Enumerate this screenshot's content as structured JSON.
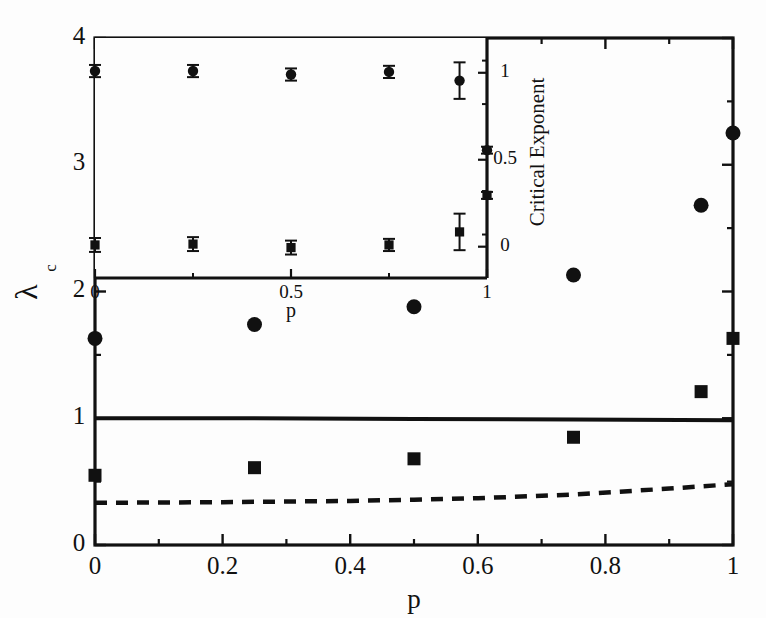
{
  "figure": {
    "background_color": "#fdfdfd",
    "ink_color": "#111111"
  },
  "chart_data": {
    "type": "scatter",
    "title": "",
    "xlabel": "p",
    "ylabel": "λ",
    "ylabel_subscript": "c",
    "xlim": [
      0,
      1
    ],
    "ylim": [
      0,
      4
    ],
    "grid": false,
    "legend_position": "none",
    "xticks": [
      0,
      0.2,
      0.4,
      0.6,
      0.8,
      1
    ],
    "xtick_labels": [
      "0",
      "0.2",
      "0.4",
      "0.6",
      "0.8",
      "1"
    ],
    "xminor_step": 0.1,
    "yticks": [
      0,
      1,
      2,
      3,
      4
    ],
    "ytick_labels": [
      "0",
      "1",
      "2",
      "3",
      "4"
    ],
    "yminor_step": 0.5,
    "series": [
      {
        "name": "circles",
        "marker": "circle",
        "x": [
          0,
          0.25,
          0.5,
          0.75,
          0.95,
          1.0
        ],
        "y": [
          1.63,
          1.74,
          1.88,
          2.13,
          2.68,
          3.25
        ]
      },
      {
        "name": "squares",
        "marker": "square",
        "x": [
          0,
          0.25,
          0.5,
          0.75,
          0.95,
          1.0
        ],
        "y": [
          0.55,
          0.61,
          0.68,
          0.85,
          1.21,
          1.63
        ]
      },
      {
        "name": "solid-line",
        "marker": "line-solid",
        "x": [
          0,
          0.25,
          0.5,
          0.75,
          1.0
        ],
        "y": [
          1.0,
          1.0,
          0.995,
          0.99,
          0.985
        ]
      },
      {
        "name": "dashed-line",
        "marker": "line-dashed",
        "x": [
          0,
          0.2,
          0.4,
          0.5,
          0.6,
          0.75,
          0.9,
          1.0
        ],
        "y": [
          0.333,
          0.338,
          0.348,
          0.357,
          0.369,
          0.398,
          0.445,
          0.48
        ]
      }
    ]
  },
  "inset_chart_data": {
    "type": "scatter",
    "title": "",
    "xlabel": "p",
    "ylabel": "Critical Exponent",
    "xlim": [
      0,
      1
    ],
    "ylim": [
      -0.18,
      1.2
    ],
    "grid": false,
    "legend_position": "none",
    "xticks": [
      0,
      0.5,
      1
    ],
    "xtick_labels": [
      "0",
      "0.5",
      "1"
    ],
    "xminor_step": 0.25,
    "yticks": [
      0,
      0.5,
      1
    ],
    "ytick_labels": [
      "0",
      "0.5",
      "1"
    ],
    "yminor_step": 0.25,
    "series": [
      {
        "name": "circles-upper",
        "marker": "circle",
        "x": [
          0,
          0.25,
          0.5,
          0.75,
          0.93,
          1.0
        ],
        "y": [
          1.01,
          1.01,
          0.99,
          1.005,
          0.955,
          0.555
        ],
        "yerr": [
          0.035,
          0.035,
          0.035,
          0.035,
          0.105,
          0.02
        ]
      },
      {
        "name": "squares-lower",
        "marker": "square",
        "x": [
          0,
          0.25,
          0.5,
          0.75,
          0.93,
          1.0
        ],
        "y": [
          0.01,
          0.015,
          -0.005,
          0.01,
          0.085,
          0.295
        ],
        "yerr": [
          0.04,
          0.04,
          0.04,
          0.035,
          0.105,
          0.02
        ]
      }
    ]
  }
}
